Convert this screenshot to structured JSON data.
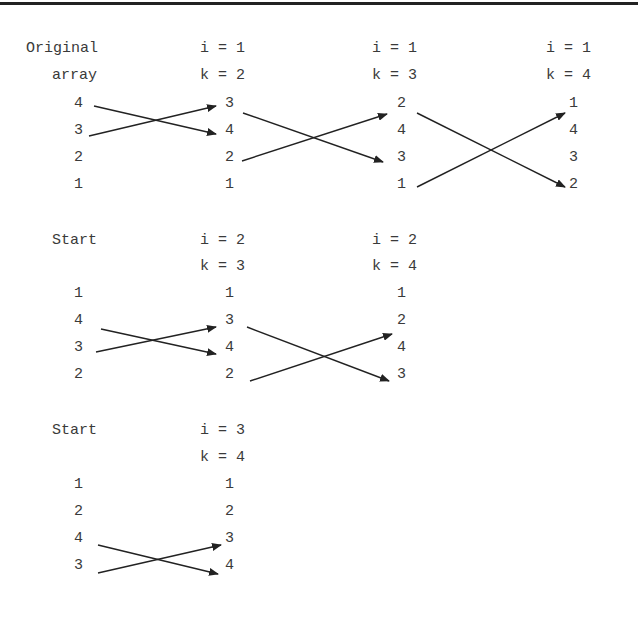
{
  "diagram": {
    "title_hint": "Selection-style swap passes over array",
    "panels": [
      {
        "start_label_line1": "Original",
        "start_label_line2": "array",
        "start_values": [
          "4",
          "3",
          "2",
          "1"
        ],
        "steps": [
          {
            "i_label": "i = 1",
            "k_label": "k = 2",
            "values": [
              "3",
              "4",
              "2",
              "1"
            ]
          },
          {
            "i_label": "i = 1",
            "k_label": "k = 3",
            "values": [
              "2",
              "4",
              "3",
              "1"
            ]
          },
          {
            "i_label": "i = 1",
            "k_label": "k = 4",
            "values": [
              "1",
              "4",
              "3",
              "2"
            ]
          }
        ]
      },
      {
        "start_label_line1": "Start",
        "start_values": [
          "1",
          "4",
          "3",
          "2"
        ],
        "steps": [
          {
            "i_label": "i = 2",
            "k_label": "k = 3",
            "values": [
              "1",
              "3",
              "4",
              "2"
            ]
          },
          {
            "i_label": "i = 2",
            "k_label": "k = 4",
            "values": [
              "1",
              "2",
              "4",
              "3"
            ]
          }
        ]
      },
      {
        "start_label_line1": "Start",
        "start_values": [
          "1",
          "2",
          "4",
          "3"
        ],
        "steps": [
          {
            "i_label": "i = 3",
            "k_label": "k = 4",
            "values": [
              "1",
              "2",
              "3",
              "4"
            ]
          }
        ]
      }
    ],
    "colors": {
      "line": "#222222",
      "text": "#3a3a3a",
      "border": "#222222"
    }
  }
}
